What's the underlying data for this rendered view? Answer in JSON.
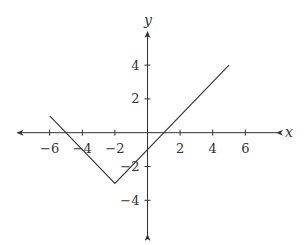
{
  "chart_data": {
    "type": "line",
    "title": "",
    "xlabel": "x",
    "ylabel": "y",
    "xlim": [
      -8,
      8
    ],
    "ylim": [
      -5.5,
      5.5
    ],
    "grid": false,
    "legend": null,
    "x_ticks": [
      -6,
      -4,
      -2,
      2,
      4,
      6
    ],
    "x_tick_labels": [
      "−6",
      "−4",
      "−2",
      "2",
      "4",
      "6"
    ],
    "y_ticks": [
      4,
      2,
      -2,
      -4
    ],
    "y_tick_labels": [
      "4",
      "2",
      "−2",
      "−4"
    ],
    "series": [
      {
        "name": "y = |x + 2| − 3",
        "x": [
          -6,
          -2,
          5
        ],
        "y": [
          1,
          -3,
          4
        ]
      }
    ],
    "annotations": []
  },
  "style": {
    "axis_color": "#333333",
    "line_color": "#333333",
    "background": "#ffffff"
  }
}
